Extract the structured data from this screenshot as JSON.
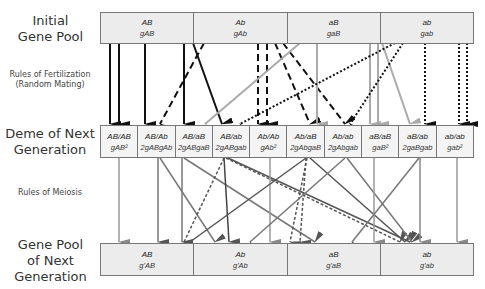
{
  "row_labels": {
    "initial": [
      "Initial",
      "Gene Pool"
    ],
    "fertilization": [
      "Rules of Fertilization",
      "(Random Mating)"
    ],
    "deme": [
      "Deme of Next",
      "Generation"
    ],
    "meiosis": "Rules of Meiosis",
    "next_pool": [
      "Gene Pool",
      "of Next",
      "Generation"
    ]
  },
  "initial_pool": [
    {
      "gamete": "AB",
      "freq": "gAB"
    },
    {
      "gamete": "Ab",
      "freq": "gAb"
    },
    {
      "gamete": "aB",
      "freq": "gaB"
    },
    {
      "gamete": "ab",
      "freq": "gab"
    }
  ],
  "deme": [
    {
      "genotype": "AB/AB",
      "freq": "gAB²"
    },
    {
      "genotype": "AB/Ab",
      "freq": "2gABgAb"
    },
    {
      "genotype": "AB/aB",
      "freq": "2gABgaB"
    },
    {
      "genotype": "AB/ab",
      "freq": "2gABgab"
    },
    {
      "genotype": "Ab/Ab",
      "freq": "gAb²"
    },
    {
      "genotype": "Ab/aB",
      "freq": "2gAbgaB"
    },
    {
      "genotype": "Ab/ab",
      "freq": "2gAbgab"
    },
    {
      "genotype": "aB/aB",
      "freq": "gaB²"
    },
    {
      "genotype": "aB/ab",
      "freq": "2gaBgab"
    },
    {
      "genotype": "ab/ab",
      "freq": "gab²"
    }
  ],
  "next_pool": [
    {
      "gamete": "AB",
      "freq": "g'AB"
    },
    {
      "gamete": "Ab",
      "freq": "g'Ab"
    },
    {
      "gamete": "aB",
      "freq": "g'aB"
    },
    {
      "gamete": "ab",
      "freq": "g'ab"
    }
  ]
}
